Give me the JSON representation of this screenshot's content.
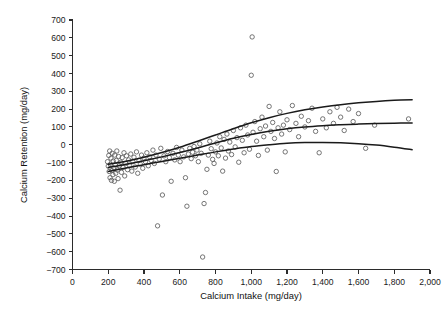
{
  "chart_data": {
    "type": "scatter",
    "title": "",
    "xlabel": "Calcium Intake (mg/day)",
    "ylabel": "Calcium Retention (mg/day)",
    "xlim": [
      0,
      2000
    ],
    "ylim": [
      -700,
      700
    ],
    "grid": false,
    "legend": "none",
    "marker": "open-circle",
    "xticks": [
      0,
      200,
      400,
      600,
      800,
      1000,
      1200,
      1400,
      1600,
      1800,
      2000
    ],
    "xticklabels": [
      "0",
      "200",
      "400",
      "600",
      "800",
      "1,000",
      "1,200",
      "1,400",
      "1,600",
      "1,800",
      "2,000"
    ],
    "yticks": [
      -700,
      -600,
      -500,
      -400,
      -300,
      -200,
      -100,
      0,
      100,
      200,
      300,
      400,
      500,
      600,
      700
    ],
    "yticklabels": [
      "−700",
      "−600",
      "−500",
      "−400",
      "−300",
      "−200",
      "−100",
      "0",
      "100",
      "200",
      "300",
      "400",
      "500",
      "600",
      "700"
    ],
    "points": [
      [
        196,
        -95
      ],
      [
        200,
        -120
      ],
      [
        203,
        -60
      ],
      [
        205,
        -150
      ],
      [
        208,
        -35
      ],
      [
        210,
        -185
      ],
      [
        212,
        -110
      ],
      [
        215,
        -75
      ],
      [
        218,
        -200
      ],
      [
        220,
        -145
      ],
      [
        222,
        -48
      ],
      [
        226,
        -168
      ],
      [
        228,
        -92
      ],
      [
        231,
        -130
      ],
      [
        234,
        -205
      ],
      [
        236,
        -58
      ],
      [
        239,
        -112
      ],
      [
        242,
        -160
      ],
      [
        245,
        -88
      ],
      [
        248,
        -35
      ],
      [
        251,
        -142
      ],
      [
        255,
        -190
      ],
      [
        258,
        -66
      ],
      [
        262,
        -118
      ],
      [
        266,
        -255
      ],
      [
        270,
        -98
      ],
      [
        274,
        -155
      ],
      [
        278,
        -72
      ],
      [
        283,
        -128
      ],
      [
        288,
        -45
      ],
      [
        292,
        -175
      ],
      [
        297,
        -105
      ],
      [
        302,
        -62
      ],
      [
        308,
        -140
      ],
      [
        314,
        -85
      ],
      [
        320,
        -118
      ],
      [
        326,
        -52
      ],
      [
        332,
        -148
      ],
      [
        338,
        -95
      ],
      [
        344,
        -70
      ],
      [
        351,
        -125
      ],
      [
        358,
        -40
      ],
      [
        365,
        -160
      ],
      [
        372,
        -88
      ],
      [
        379,
        -108
      ],
      [
        386,
        -58
      ],
      [
        393,
        -132
      ],
      [
        400,
        -75
      ],
      [
        408,
        -95
      ],
      [
        416,
        -45
      ],
      [
        424,
        -118
      ],
      [
        432,
        -68
      ],
      [
        440,
        -88
      ],
      [
        450,
        -30
      ],
      [
        458,
        -105
      ],
      [
        467,
        -58
      ],
      [
        476,
        -455
      ],
      [
        485,
        -80
      ],
      [
        494,
        -20
      ],
      [
        503,
        -282
      ],
      [
        512,
        -62
      ],
      [
        522,
        -95
      ],
      [
        532,
        -38
      ],
      [
        542,
        -72
      ],
      [
        552,
        -205
      ],
      [
        562,
        -48
      ],
      [
        572,
        -85
      ],
      [
        582,
        -15
      ],
      [
        592,
        -58
      ],
      [
        602,
        -95
      ],
      [
        612,
        -30
      ],
      [
        622,
        -68
      ],
      [
        632,
        -185
      ],
      [
        640,
        -345
      ],
      [
        648,
        -52
      ],
      [
        656,
        -20
      ],
      [
        664,
        -78
      ],
      [
        672,
        -42
      ],
      [
        680,
        -10
      ],
      [
        688,
        -62
      ],
      [
        696,
        -30
      ],
      [
        704,
        -95
      ],
      [
        712,
        5
      ],
      [
        720,
        -48
      ],
      [
        728,
        -630
      ],
      [
        736,
        -330
      ],
      [
        744,
        -268
      ],
      [
        752,
        -138
      ],
      [
        760,
        -58
      ],
      [
        768,
        20
      ],
      [
        776,
        -22
      ],
      [
        784,
        -82
      ],
      [
        792,
        -105
      ],
      [
        800,
        -40
      ],
      [
        808,
        10
      ],
      [
        816,
        -62
      ],
      [
        824,
        45
      ],
      [
        832,
        -18
      ],
      [
        840,
        -148
      ],
      [
        848,
        30
      ],
      [
        856,
        -75
      ],
      [
        864,
        60
      ],
      [
        872,
        -35
      ],
      [
        880,
        15
      ],
      [
        890,
        -55
      ],
      [
        900,
        80
      ],
      [
        910,
        -12
      ],
      [
        920,
        40
      ],
      [
        930,
        -98
      ],
      [
        940,
        95
      ],
      [
        950,
        25
      ],
      [
        960,
        -45
      ],
      [
        970,
        110
      ],
      [
        980,
        55
      ],
      [
        990,
        -25
      ],
      [
        1000,
        390
      ],
      [
        1005,
        605
      ],
      [
        1010,
        70
      ],
      [
        1020,
        130
      ],
      [
        1030,
        20
      ],
      [
        1040,
        -60
      ],
      [
        1050,
        90
      ],
      [
        1060,
        155
      ],
      [
        1070,
        45
      ],
      [
        1080,
        105
      ],
      [
        1090,
        -30
      ],
      [
        1100,
        215
      ],
      [
        1110,
        75
      ],
      [
        1120,
        125
      ],
      [
        1130,
        35
      ],
      [
        1140,
        -150
      ],
      [
        1150,
        95
      ],
      [
        1160,
        185
      ],
      [
        1170,
        60
      ],
      [
        1180,
        110
      ],
      [
        1190,
        -40
      ],
      [
        1200,
        140
      ],
      [
        1215,
        85
      ],
      [
        1230,
        220
      ],
      [
        1250,
        120
      ],
      [
        1265,
        45
      ],
      [
        1280,
        160
      ],
      [
        1300,
        100
      ],
      [
        1320,
        135
      ],
      [
        1340,
        205
      ],
      [
        1360,
        75
      ],
      [
        1380,
        -45
      ],
      [
        1400,
        145
      ],
      [
        1420,
        95
      ],
      [
        1440,
        185
      ],
      [
        1460,
        120
      ],
      [
        1480,
        210
      ],
      [
        1500,
        155
      ],
      [
        1520,
        80
      ],
      [
        1545,
        200
      ],
      [
        1570,
        130
      ],
      [
        1600,
        175
      ],
      [
        1640,
        -20
      ],
      [
        1690,
        110
      ],
      [
        1880,
        145
      ]
    ],
    "fit_lines": [
      {
        "name": "upper-confidence-band",
        "x": [
          200,
          300,
          400,
          500,
          600,
          700,
          800,
          900,
          1000,
          1100,
          1200,
          1300,
          1400,
          1500,
          1600,
          1700,
          1800,
          1900
        ],
        "y": [
          -110,
          -92,
          -70,
          -44,
          -14,
          20,
          55,
          90,
          123,
          152,
          176,
          196,
          212,
          225,
          235,
          243,
          249,
          253
        ]
      },
      {
        "name": "fitted-curve",
        "x": [
          200,
          300,
          400,
          500,
          600,
          700,
          800,
          900,
          1000,
          1100,
          1200,
          1300,
          1400,
          1500,
          1600,
          1700,
          1800,
          1900
        ],
        "y": [
          -128,
          -110,
          -90,
          -68,
          -44,
          -18,
          10,
          36,
          58,
          76,
          90,
          100,
          107,
          112,
          116,
          119,
          121,
          122
        ]
      },
      {
        "name": "lower-confidence-band",
        "x": [
          200,
          300,
          400,
          500,
          600,
          700,
          800,
          900,
          1000,
          1100,
          1200,
          1300,
          1400,
          1500,
          1600,
          1700,
          1800,
          1900
        ],
        "y": [
          -150,
          -130,
          -112,
          -94,
          -76,
          -58,
          -40,
          -24,
          -10,
          0,
          8,
          12,
          13,
          11,
          6,
          -2,
          -14,
          -28
        ]
      }
    ]
  }
}
